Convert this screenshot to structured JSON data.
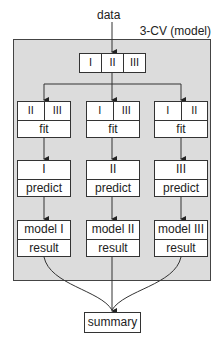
{
  "title": "data",
  "container_label": "3-CV (model)",
  "top_split": [
    "I",
    "II",
    "III"
  ],
  "folds": [
    {
      "train": [
        "II",
        "III"
      ],
      "fit_label": "fit",
      "test": "I",
      "predict_label": "predict",
      "model": "model I",
      "result_label": "result"
    },
    {
      "train": [
        "I",
        "III"
      ],
      "fit_label": "fit",
      "test": "II",
      "predict_label": "predict",
      "model": "model II",
      "result_label": "result"
    },
    {
      "train": [
        "I",
        "II"
      ],
      "fit_label": "fit",
      "test": "III",
      "predict_label": "predict",
      "model": "model III",
      "result_label": "result"
    }
  ],
  "summary": "summary",
  "colors": {
    "container_bg": "#dcdcdc",
    "line": "#333333",
    "box_bg": "#ffffff"
  }
}
